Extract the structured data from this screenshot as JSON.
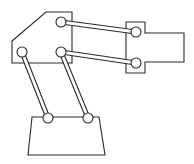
{
  "diagram": {
    "colors": {
      "stroke": "#2a2a2a",
      "fill": "#ffffff",
      "background": "#ffffff"
    },
    "parts": {
      "upper_body": {
        "points": "12,41 46,12 72,12 72,63 12,63"
      },
      "end_effector_tab": {
        "points": "126,22 145,22 145,33 184,33 184,62 145,62 145,73 126,73"
      },
      "base": {
        "points": "32,117 99,117 105,155 28,155"
      }
    },
    "links": [
      {
        "name": "upper-parallel-link-top",
        "x1": 61,
        "y1": 22,
        "x2": 136,
        "y2": 32
      },
      {
        "name": "upper-parallel-link-bottom",
        "x1": 61,
        "y1": 52,
        "x2": 136,
        "y2": 63
      },
      {
        "name": "lower-parallel-link-left",
        "x1": 22,
        "y1": 52,
        "x2": 48,
        "y2": 118
      },
      {
        "name": "lower-parallel-link-right",
        "x1": 61,
        "y1": 52,
        "x2": 88,
        "y2": 118
      }
    ],
    "joints": [
      {
        "name": "joint-body-top",
        "cx": 61,
        "cy": 22
      },
      {
        "name": "joint-body-left",
        "cx": 22,
        "cy": 52
      },
      {
        "name": "joint-body-right",
        "cx": 61,
        "cy": 52
      },
      {
        "name": "joint-effector-top",
        "cx": 136,
        "cy": 32
      },
      {
        "name": "joint-effector-bottom",
        "cx": 136,
        "cy": 63
      },
      {
        "name": "joint-base-left",
        "cx": 48,
        "cy": 118
      },
      {
        "name": "joint-base-right",
        "cx": 88,
        "cy": 118
      }
    ],
    "joint_radius": 5,
    "rod_width": 5
  }
}
